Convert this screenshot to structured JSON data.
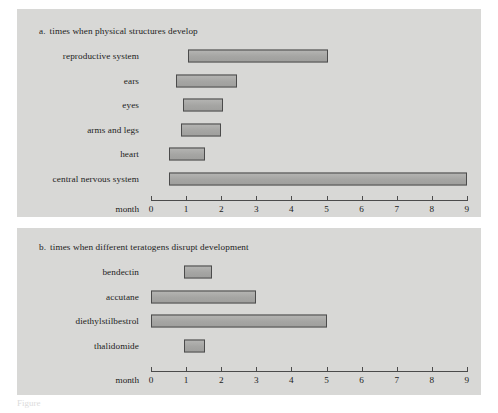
{
  "figure": {
    "caption_fragment": "Figure",
    "bar_fill": "#a8a8a6",
    "bar_stroke": "#4b4b4b",
    "panel_background": "#d8d8d6",
    "page_background": "#ffffff"
  },
  "panels": [
    {
      "id": "a",
      "letter": "a.",
      "title": "times when physical structures develop",
      "axis_name": "month"
    },
    {
      "id": "b",
      "letter": "b.",
      "title": "times when different teratogens disrupt development",
      "axis_name": "month"
    }
  ],
  "chart_data": [
    {
      "type": "bar",
      "orientation": "horizontal",
      "subtype": "range-bar",
      "panel": "a",
      "title": "times when physical structures develop",
      "xlabel": "month",
      "ylabel": "",
      "xlim": [
        0,
        9
      ],
      "xticks": [
        0,
        1,
        2,
        3,
        4,
        5,
        6,
        7,
        8,
        9
      ],
      "xtick_labels": [
        "0",
        "1",
        "2",
        "3",
        "4",
        "5",
        "6",
        "7",
        "8",
        "9"
      ],
      "grid": false,
      "legend": "none",
      "categories": [
        "reproductive system",
        "ears",
        "eyes",
        "arms and legs",
        "heart",
        "central nervous system"
      ],
      "ranges": [
        {
          "label": "reproductive system",
          "start": 1.05,
          "end": 5.05
        },
        {
          "label": "ears",
          "start": 0.7,
          "end": 2.45
        },
        {
          "label": "eyes",
          "start": 0.9,
          "end": 2.05
        },
        {
          "label": "arms and legs",
          "start": 0.85,
          "end": 2.0
        },
        {
          "label": "heart",
          "start": 0.5,
          "end": 1.55
        },
        {
          "label": "central nervous system",
          "start": 0.5,
          "end": 9.0
        }
      ]
    },
    {
      "type": "bar",
      "orientation": "horizontal",
      "subtype": "range-bar",
      "panel": "b",
      "title": "times when different teratogens disrupt development",
      "xlabel": "month",
      "ylabel": "",
      "xlim": [
        0,
        9
      ],
      "xticks": [
        0,
        1,
        2,
        3,
        4,
        5,
        6,
        7,
        8,
        9
      ],
      "xtick_labels": [
        "0",
        "1",
        "2",
        "3",
        "4",
        "5",
        "6",
        "7",
        "8",
        "9"
      ],
      "grid": false,
      "legend": "none",
      "categories": [
        "bendectin",
        "accutane",
        "diethylstilbestrol",
        "thalidomide"
      ],
      "ranges": [
        {
          "label": "bendectin",
          "start": 0.95,
          "end": 1.75
        },
        {
          "label": "accutane",
          "start": 0.0,
          "end": 3.0
        },
        {
          "label": "diethylstilbestrol",
          "start": 0.0,
          "end": 5.0
        },
        {
          "label": "thalidomide",
          "start": 0.95,
          "end": 1.55
        }
      ]
    }
  ]
}
